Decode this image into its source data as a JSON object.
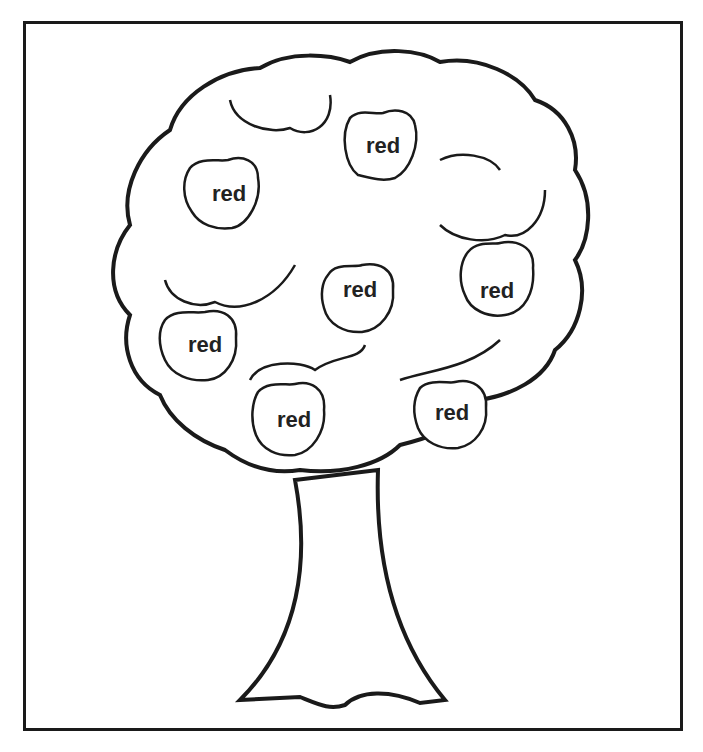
{
  "worksheet": {
    "title": "Apple tree coloring page",
    "apples": [
      {
        "label": "red",
        "x": 383,
        "y": 145
      },
      {
        "label": "red",
        "x": 229,
        "y": 193
      },
      {
        "label": "red",
        "x": 497,
        "y": 290
      },
      {
        "label": "red",
        "x": 360,
        "y": 290
      },
      {
        "label": "red",
        "x": 205,
        "y": 345
      },
      {
        "label": "red",
        "x": 294,
        "y": 420
      },
      {
        "label": "red",
        "x": 452,
        "y": 413
      }
    ],
    "colors": {
      "ink": "#1a1a1a",
      "background": "#ffffff"
    }
  }
}
